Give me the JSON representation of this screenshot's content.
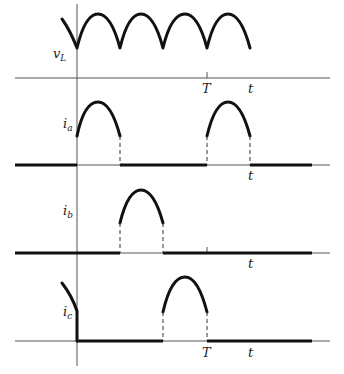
{
  "figure": {
    "panels": [
      {
        "id": "vL",
        "label": "v",
        "label_sub": "L",
        "tick_label": "T",
        "time_label": "t"
      },
      {
        "id": "ia",
        "label": "i",
        "label_sub": "a",
        "time_label": "t"
      },
      {
        "id": "ib",
        "label": "i",
        "label_sub": "b",
        "time_label": "t"
      },
      {
        "id": "ic",
        "label": "i",
        "label_sub": "c",
        "tick_label": "T",
        "time_label": "t"
      }
    ],
    "colors": {
      "waveform": "#111111",
      "axis": "#555555",
      "background": "#ffffff"
    }
  }
}
